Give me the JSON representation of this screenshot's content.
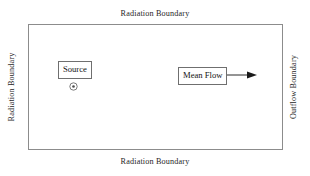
{
  "diagram": {
    "background_color": "#ffffff",
    "border_color": "#8c8c8c",
    "text_color": "#1a1a1a"
  },
  "boundaries": {
    "top": "Radiation Boundary",
    "bottom": "Radiation Boundary",
    "left": "Radiation Boundary",
    "right": "Outflow Boundary"
  },
  "annotations": {
    "source": {
      "label": "Source",
      "marker": "concentric-circle"
    },
    "mean_flow": {
      "label": "Mean Flow",
      "arrow_direction": "right"
    }
  }
}
